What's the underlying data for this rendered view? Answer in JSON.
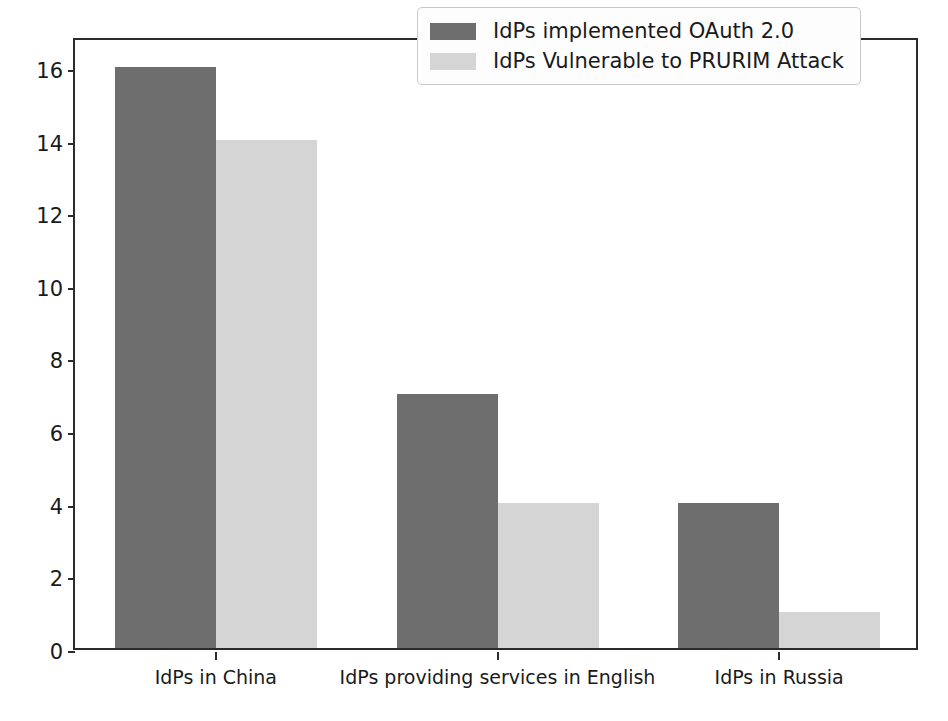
{
  "chart_data": {
    "type": "bar",
    "title": "",
    "xlabel": "",
    "ylabel": "",
    "categories": [
      "IdPs in China",
      "IdPs providing services in English",
      "IdPs in Russia"
    ],
    "series": [
      {
        "name": "IdPs implemented OAuth 2.0",
        "color": "#6e6e6e",
        "values": [
          16,
          7,
          4
        ]
      },
      {
        "name": "IdPs Vulnerable to PRURIM Attack",
        "color": "#d5d5d5",
        "values": [
          14,
          4,
          1
        ]
      }
    ],
    "ylim": [
      0,
      16.85
    ],
    "yticks": [
      0,
      2,
      4,
      6,
      8,
      10,
      12,
      14,
      16
    ],
    "ytick_labels": [
      "0",
      "2",
      "4",
      "6",
      "8",
      "10",
      "12",
      "14",
      "16"
    ],
    "grid": false,
    "legend_position": "upper right",
    "axis_color": "#2b2b2b",
    "background_color": "#ffffff"
  }
}
